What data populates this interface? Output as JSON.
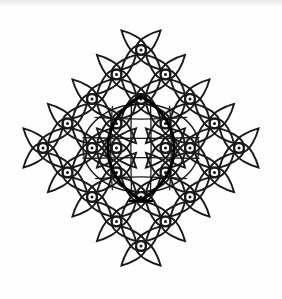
{
  "artwork": {
    "title": "Kolam Lattice Diagram",
    "type": "line-drawing",
    "description": "Symmetric South Indian kolam (sikku kolam) built on a diamond-shaped diagonal dot lattice, each dot enclosed by a four-lobed interlaced loop, with a bold vesica-shaped medallion at the centre containing a curved internal grid.",
    "background_color": "#fefefe",
    "ink_color": "#1a1a1a",
    "accent_ink_color": "#000000",
    "canvas": {
      "width": 282,
      "height": 299
    }
  },
  "geometry": {
    "center": {
      "x": 141,
      "y": 148
    },
    "lattice": {
      "spacing": 24.5,
      "orientation": "diagonal",
      "rings": 5,
      "dot_radius": 1.5,
      "loop_radius": 17.5,
      "stroke_width": 1.9
    },
    "dots": [
      {
        "x": 141,
        "y": 50,
        "ring": 4
      },
      {
        "x": 116.5,
        "y": 74.5,
        "ring": 4
      },
      {
        "x": 165.5,
        "y": 74.5,
        "ring": 4
      },
      {
        "x": 92,
        "y": 99,
        "ring": 4
      },
      {
        "x": 141,
        "y": 99,
        "ring": 3
      },
      {
        "x": 190,
        "y": 99,
        "ring": 4
      },
      {
        "x": 67.5,
        "y": 123.5,
        "ring": 4
      },
      {
        "x": 116.5,
        "y": 123.5,
        "ring": 3
      },
      {
        "x": 165.5,
        "y": 123.5,
        "ring": 3
      },
      {
        "x": 214.5,
        "y": 123.5,
        "ring": 4
      },
      {
        "x": 43,
        "y": 148,
        "ring": 4
      },
      {
        "x": 92,
        "y": 148,
        "ring": 3
      },
      {
        "x": 116.5,
        "y": 148,
        "ring": 2
      },
      {
        "x": 165.5,
        "y": 148,
        "ring": 2
      },
      {
        "x": 190,
        "y": 148,
        "ring": 3
      },
      {
        "x": 239,
        "y": 148,
        "ring": 4
      },
      {
        "x": 67.5,
        "y": 172.5,
        "ring": 4
      },
      {
        "x": 116.5,
        "y": 172.5,
        "ring": 3
      },
      {
        "x": 165.5,
        "y": 172.5,
        "ring": 3
      },
      {
        "x": 214.5,
        "y": 172.5,
        "ring": 4
      },
      {
        "x": 92,
        "y": 197,
        "ring": 4
      },
      {
        "x": 141,
        "y": 197,
        "ring": 3
      },
      {
        "x": 190,
        "y": 197,
        "ring": 4
      },
      {
        "x": 116.5,
        "y": 221.5,
        "ring": 4
      },
      {
        "x": 165.5,
        "y": 221.5,
        "ring": 4
      },
      {
        "x": 141,
        "y": 246,
        "ring": 4
      }
    ],
    "medallion": {
      "shape": "vesica",
      "cx": 141,
      "cy": 148,
      "rx": 34,
      "ry": 52,
      "stroke_width": 3.2,
      "inner_ellipse": {
        "rx": 58,
        "ry": 44,
        "stroke_width": 1.4
      },
      "inner_grid_vertical": 4,
      "inner_grid_horizontal": 4
    }
  },
  "labels": {
    "figure_caption": "Kolam Lattice Diagram"
  }
}
